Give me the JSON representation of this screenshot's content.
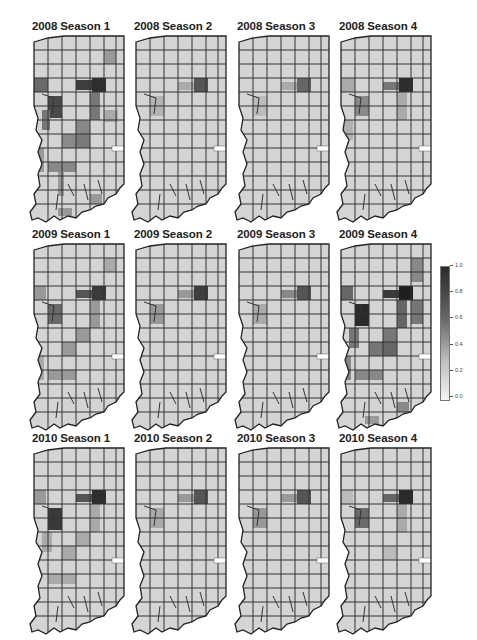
{
  "chart_data": {
    "type": "heatmap",
    "subtype": "choropleth small multiples",
    "title": "",
    "region": "Indiana counties",
    "layout": {
      "rows": 3,
      "cols": 4,
      "legend_position": "right"
    },
    "panels": [
      {
        "title": "2008 Season 1",
        "intensity": "high"
      },
      {
        "title": "2008 Season 2",
        "intensity": "low"
      },
      {
        "title": "2008 Season 3",
        "intensity": "low"
      },
      {
        "title": "2008 Season 4",
        "intensity": "medium"
      },
      {
        "title": "2009 Season 1",
        "intensity": "medium"
      },
      {
        "title": "2009 Season 2",
        "intensity": "low"
      },
      {
        "title": "2009 Season 3",
        "intensity": "low"
      },
      {
        "title": "2009 Season 4",
        "intensity": "high"
      },
      {
        "title": "2010 Season 1",
        "intensity": "medium"
      },
      {
        "title": "2010 Season 2",
        "intensity": "low"
      },
      {
        "title": "2010 Season 3",
        "intensity": "low"
      },
      {
        "title": "2010 Season 4",
        "intensity": "medium"
      }
    ],
    "county_labels": [
      "Grant",
      "Franklin"
    ],
    "colorbar": {
      "min": 0.0,
      "max": 1.0,
      "ticks": [
        "1.0",
        "0.8",
        "0.6",
        "0.4",
        "0.2",
        "0.0"
      ],
      "colors": {
        "high": "#2a2a2a",
        "low": "#f4f4f4"
      }
    }
  },
  "legend": {
    "ticks": [
      "1.0",
      "0.8",
      "0.6",
      "0.4",
      "0.2",
      "0.0"
    ]
  },
  "panels": [
    {
      "title": "2008 Season 1"
    },
    {
      "title": "2008 Season 2"
    },
    {
      "title": "2008 Season 3"
    },
    {
      "title": "2008 Season 4"
    },
    {
      "title": "2009 Season 1"
    },
    {
      "title": "2009 Season 2"
    },
    {
      "title": "2009 Season 3"
    },
    {
      "title": "2009 Season 4"
    },
    {
      "title": "2010 Season 1"
    },
    {
      "title": "2010 Season 2"
    },
    {
      "title": "2010 Season 3"
    },
    {
      "title": "2010 Season 4"
    }
  ]
}
